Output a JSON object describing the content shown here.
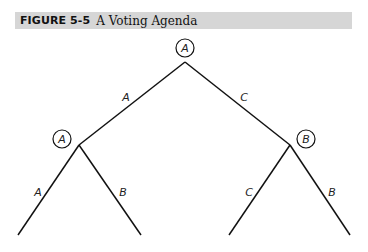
{
  "figure": {
    "number": "FIGURE 5-5",
    "title": "A Voting Agenda"
  },
  "tree": {
    "root": {
      "label": "A"
    },
    "left_node": {
      "label": "A"
    },
    "right_node": {
      "label": "B"
    },
    "edges": {
      "root_left": "A",
      "root_right": "C",
      "left_left": "A",
      "left_right": "B",
      "right_left": "C",
      "right_right": "B"
    }
  },
  "colors": {
    "title_bar_bg": "#d6d6d6",
    "line": "#111111"
  }
}
